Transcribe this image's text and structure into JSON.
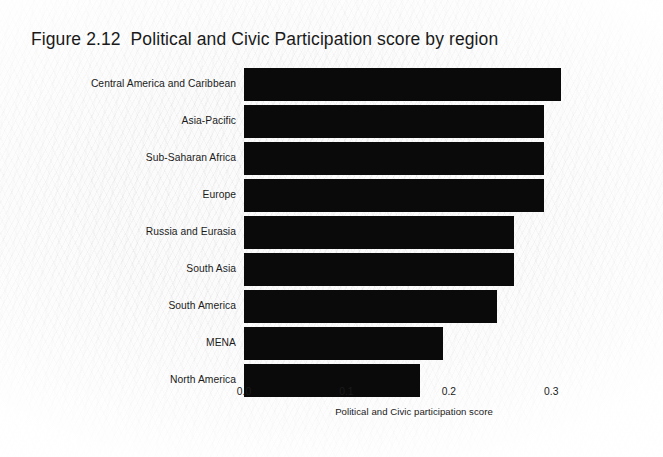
{
  "figure": {
    "title": "Figure 2.12  Political and Civic Participation score by region",
    "background_color": "#fbfbfb",
    "bar_color": "#0a0a0a",
    "text_color": "#1b1b1b"
  },
  "chart_data": {
    "type": "bar",
    "orientation": "horizontal",
    "title": "Figure 2.12  Political and Civic Participation score by region",
    "xlabel": "Political and Civic participation score",
    "ylabel": "",
    "xlim": [
      0.0,
      0.332
    ],
    "xticks": [
      "0.0",
      "0.1",
      "0.2",
      "0.3"
    ],
    "xtick_values": [
      0.0,
      0.1,
      0.2,
      0.3
    ],
    "grid": false,
    "legend": null,
    "categories": [
      "Central America and Caribbean",
      "Asia-Pacific",
      "Sub-Saharan Africa",
      "Europe",
      "Russia and Eurasia",
      "South Asia",
      "South America",
      "MENA",
      "North America"
    ],
    "values": [
      0.31,
      0.293,
      0.293,
      0.293,
      0.264,
      0.264,
      0.247,
      0.194,
      0.172
    ]
  }
}
